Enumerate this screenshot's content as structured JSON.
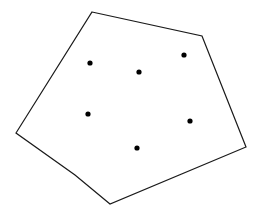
{
  "figure": {
    "canvas": {
      "width": 261,
      "height": 217,
      "background_color": "#ffffff"
    },
    "shape": {
      "name": "polygon-outline",
      "kind": "convex-polygon",
      "stroke_color": "#1a1a1a",
      "stroke_width": 1.2,
      "fill": "none",
      "vertex_count": 6,
      "vertices": [
        {
          "label": "apex",
          "x": 92,
          "y": 12
        },
        {
          "label": "top-right",
          "x": 202,
          "y": 36
        },
        {
          "label": "right",
          "x": 246,
          "y": 147
        },
        {
          "label": "bottom",
          "x": 110,
          "y": 204
        },
        {
          "label": "lower-left-bend",
          "x": 75,
          "y": 175
        },
        {
          "label": "left",
          "x": 16,
          "y": 133
        }
      ],
      "points_path": "92,12 202,36 246,147 110,204 75,175 16,133"
    },
    "points": {
      "name": "interior-points",
      "count": 6,
      "color": "#000000",
      "radius": 2.6,
      "items": [
        {
          "id": "point-1",
          "x": 90,
          "y": 63
        },
        {
          "id": "point-2",
          "x": 139,
          "y": 72
        },
        {
          "id": "point-3",
          "x": 184,
          "y": 55
        },
        {
          "id": "point-4",
          "x": 88,
          "y": 114
        },
        {
          "id": "point-5",
          "x": 190,
          "y": 121
        },
        {
          "id": "point-6",
          "x": 137,
          "y": 148
        }
      ]
    }
  }
}
